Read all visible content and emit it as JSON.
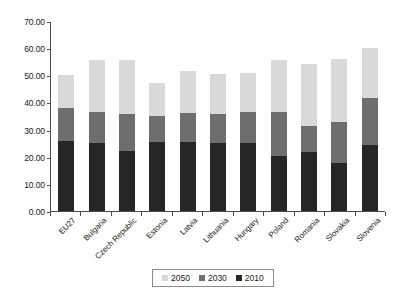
{
  "chart_data": {
    "type": "bar",
    "stacked": true,
    "title": "",
    "xlabel": "",
    "ylabel": "",
    "ylim": [
      0,
      70
    ],
    "yticks": [
      "0.00",
      "10.00",
      "20.00",
      "30.00",
      "40.00",
      "50.00",
      "60.00",
      "70.00"
    ],
    "ytick_values": [
      0,
      10,
      20,
      30,
      40,
      50,
      60,
      70
    ],
    "grid": false,
    "legend_position": "bottom",
    "categories": [
      "EU27",
      "Bulgaria",
      "Czech Republic",
      "Estonia",
      "Latvia",
      "Lithuania",
      "Hungary",
      "Poland",
      "Romania",
      "Slovakia",
      "Slovenia"
    ],
    "series": [
      {
        "name": "2010",
        "color": "#262626",
        "values": [
          25.7,
          25.2,
          22.2,
          25.5,
          25.6,
          25.2,
          24.9,
          20.1,
          21.9,
          17.6,
          24.5
        ]
      },
      {
        "name": "2030",
        "color": "#6e6e6e",
        "values": [
          12.3,
          11.2,
          13.4,
          9.5,
          10.6,
          10.7,
          11.4,
          16.2,
          9.4,
          15.1,
          17.0
        ]
      },
      {
        "name": "2050",
        "color": "#d9d9d9",
        "values": [
          12.0,
          19.1,
          19.9,
          12.0,
          15.3,
          14.6,
          14.6,
          19.3,
          22.9,
          23.3,
          18.5
        ]
      }
    ],
    "totals": [
      50.0,
      55.5,
      55.5,
      47.0,
      51.5,
      50.5,
      50.9,
      55.6,
      54.2,
      56.0,
      60.0
    ],
    "legend": [
      {
        "label": "2050",
        "color": "#d9d9d9"
      },
      {
        "label": "2030",
        "color": "#6e6e6e"
      },
      {
        "label": "2010",
        "color": "#262626"
      }
    ]
  }
}
